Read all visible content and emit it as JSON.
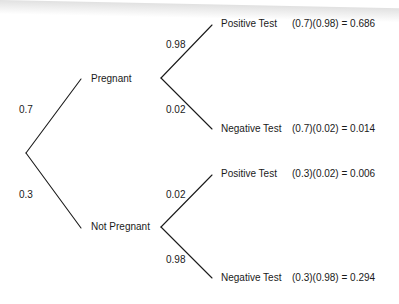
{
  "diagram": {
    "type": "probability-tree",
    "root": {
      "branches": [
        {
          "probability": "0.7",
          "label": "Pregnant",
          "branches": [
            {
              "probability": "0.98",
              "label": "Positive Test",
              "result": "(0.7)(0.98) = 0.686"
            },
            {
              "probability": "0.02",
              "label": "Negative Test",
              "result": "(0.7)(0.02) = 0.014"
            }
          ]
        },
        {
          "probability": "0.3",
          "label": "Not Pregnant",
          "branches": [
            {
              "probability": "0.02",
              "label": "Positive Test",
              "result": "(0.3)(0.02) = 0.006"
            },
            {
              "probability": "0.98",
              "label": "Negative Test",
              "result": "(0.3)(0.98) = 0.294"
            }
          ]
        }
      ]
    },
    "line_color": "#1a1a1a",
    "text_color": "#1a1a1a"
  }
}
